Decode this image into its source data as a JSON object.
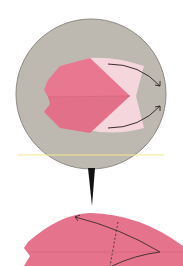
{
  "diagram": {
    "type": "origami-instruction",
    "steps": [
      {
        "label": "Step detail (circle inset)",
        "action": "Fold the light flaps outward",
        "arrows": 2
      },
      {
        "label": "Result / next step",
        "action": "Fold along dashed line",
        "arrows": 2
      }
    ],
    "colors": {
      "background": "#ffffff",
      "circle_bg": "#bdb9b1",
      "circle_border": "#8e8a83",
      "paper_pink": "#e8778f",
      "paper_pink_dark": "#d8637c",
      "paper_light": "#f4d6dc",
      "arrow": "#3a2a2e",
      "guide_line": "#f2e98a",
      "pointer": "#111111"
    }
  }
}
